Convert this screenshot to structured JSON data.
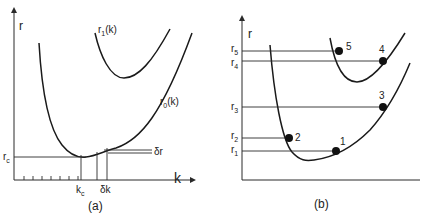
{
  "panel_a": {
    "caption": "(a)",
    "y_axis_label": "r",
    "x_axis_label": "k",
    "curve_upper_label": "r",
    "curve_upper_sub": "1",
    "curve_upper_suffix": "(k)",
    "curve_lower_label": "r",
    "curve_lower_sub": "0",
    "curve_lower_suffix": "(k)",
    "rc_label": "r",
    "rc_sub": "c",
    "kc_label": "k",
    "kc_sub": "c",
    "dk_label": "δk",
    "dr_label": "δr"
  },
  "panel_b": {
    "caption": "(b)",
    "y_axis_label": "r",
    "levels": [
      {
        "label": "r",
        "sub": "5"
      },
      {
        "label": "r",
        "sub": "4"
      },
      {
        "label": "r",
        "sub": "3"
      },
      {
        "label": "r",
        "sub": "2"
      },
      {
        "label": "r",
        "sub": "1"
      }
    ],
    "points": [
      "1",
      "2",
      "3",
      "4",
      "5"
    ]
  }
}
